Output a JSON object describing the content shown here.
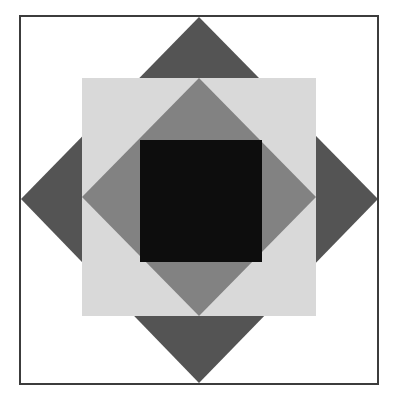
{
  "figure": {
    "title": "Geometric quilt block pattern",
    "canvas": {
      "width": 397,
      "height": 404,
      "background_color": "#ffffff"
    },
    "colors": {
      "background": "#ffffff",
      "frame_stroke": "#3c3c3c",
      "dark_gray": "#545454",
      "medium_gray": "#828282",
      "light_gray": "#d9d9d9",
      "black": "#0d0d0d"
    },
    "shapes": [
      {
        "name": "outer-frame",
        "type": "rect",
        "x": 20,
        "y": 16,
        "width": 358,
        "height": 368,
        "fill": "#ffffff",
        "stroke": "#3c3c3c",
        "stroke_width": 2
      },
      {
        "name": "dark-diamond",
        "type": "polygon",
        "fill": "#545454",
        "points": "199,17 378,199 199,383 21,199"
      },
      {
        "name": "light-square",
        "type": "rect",
        "x": 82,
        "y": 78,
        "width": 234,
        "height": 238,
        "fill": "#d9d9d9"
      },
      {
        "name": "medium-diamond",
        "type": "polygon",
        "fill": "#828282",
        "points": "199,78 316,197 199,316 82,197"
      },
      {
        "name": "black-center-square",
        "type": "rect",
        "x": 140,
        "y": 140,
        "width": 122,
        "height": 122,
        "fill": "#0d0d0d"
      }
    ],
    "geometry_notes": {
      "diamond_vertices_top": "199,17",
      "diamond_vertices_right": "378,199",
      "diamond_vertices_bottom": "199,383",
      "diamond_vertices_left": "21,199",
      "light_square_top_left": "82,78",
      "light_square_bottom_right": "316,316",
      "black_square_top_left": "140,140",
      "black_square_bottom_right": "262,262"
    }
  }
}
